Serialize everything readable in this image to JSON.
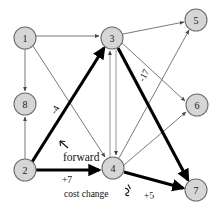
{
  "figure": {
    "background_color": "#ffffff",
    "node_fill": "#d6d6d6",
    "node_stroke": "#6e6e6e",
    "thin_edge_color": "#6a6a6a",
    "thick_edge_color": "#000000"
  },
  "nodes": [
    {
      "id": "1",
      "label": "1",
      "cx": 25,
      "cy": 38,
      "r": 11
    },
    {
      "id": "8",
      "label": "8",
      "cx": 25,
      "cy": 104,
      "r": 11
    },
    {
      "id": "2",
      "label": "2",
      "cx": 25,
      "cy": 170,
      "r": 11
    },
    {
      "id": "3",
      "label": "3",
      "cx": 112,
      "cy": 38,
      "r": 11
    },
    {
      "id": "4",
      "label": "4",
      "cx": 113,
      "cy": 168,
      "r": 11
    },
    {
      "id": "5",
      "label": "5",
      "cx": 196,
      "cy": 20,
      "r": 11
    },
    {
      "id": "6",
      "label": "6",
      "cx": 197,
      "cy": 105,
      "r": 11
    },
    {
      "id": "7",
      "label": "7",
      "cx": 196,
      "cy": 190,
      "r": 11
    }
  ],
  "edges": [
    {
      "from": "1",
      "to": "3",
      "style": "thin",
      "arrow": true
    },
    {
      "from": "1",
      "to": "8",
      "style": "thin",
      "arrow": true
    },
    {
      "from": "1",
      "to": "4",
      "style": "thin",
      "arrow": true
    },
    {
      "from": "2",
      "to": "8",
      "style": "thin",
      "arrow": true
    },
    {
      "from": "2",
      "to": "3",
      "style": "thick",
      "arrow": true,
      "label": "-4"
    },
    {
      "from": "2",
      "to": "4",
      "style": "thick",
      "arrow": true,
      "label": "+7"
    },
    {
      "from": "3",
      "to": "5",
      "style": "thin",
      "arrow": true
    },
    {
      "from": "3",
      "to": "6",
      "style": "thin",
      "arrow": true
    },
    {
      "from": "3",
      "to": "7",
      "style": "thick",
      "arrow": true,
      "label": "-17"
    },
    {
      "from": "3",
      "to": "4",
      "style": "parallel-down",
      "arrow": true
    },
    {
      "from": "4",
      "to": "3",
      "style": "parallel-up",
      "arrow": true
    },
    {
      "from": "4",
      "to": "5",
      "style": "thin",
      "arrow": true
    },
    {
      "from": "4",
      "to": "6",
      "style": "thin",
      "arrow": true
    },
    {
      "from": "4",
      "to": "7",
      "style": "thick",
      "arrow": true,
      "label": "+5"
    }
  ],
  "annotations": {
    "forward": "forward",
    "cost_change": "cost change",
    "cost_4": "-4",
    "cost_7": "+7",
    "cost_17": "-17",
    "cost_5": "+5",
    "pointer_marks": [
      "forward-pointer-arrow",
      "cost-change-pointer-arrow"
    ]
  }
}
